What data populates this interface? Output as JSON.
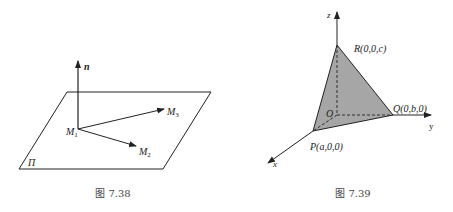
{
  "figures": [
    {
      "id": "fig-7-38",
      "caption": "图 7.38",
      "labels": {
        "normal": "n",
        "m1": "M",
        "m1_sub": "1",
        "m2": "M",
        "m2_sub": "2",
        "m3": "M",
        "m3_sub": "3",
        "plane": "Π"
      }
    },
    {
      "id": "fig-7-39",
      "caption": "图 7.39",
      "labels": {
        "z_axis": "z",
        "y_axis": "y",
        "x_axis": "x",
        "origin": "O",
        "point_r": "R(0,0,c)",
        "point_q": "Q(0,b,0)",
        "point_p": "P(a,0,0)"
      },
      "fill_color": "#a6a6a6"
    }
  ],
  "colors": {
    "stroke": "#222222",
    "triangle_fill": "#a6a6a6",
    "caption": "#444444"
  }
}
